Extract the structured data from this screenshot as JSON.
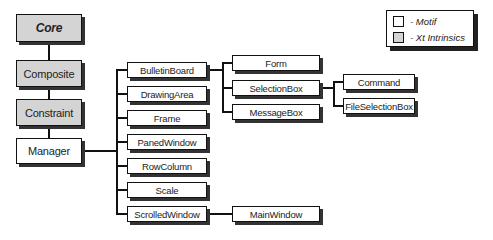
{
  "diagram": {
    "type": "class-hierarchy",
    "nodes": {
      "core": "Core",
      "composite": "Composite",
      "constraint": "Constraint",
      "manager": "Manager",
      "bulletinboard": "BulletinBoard",
      "drawingarea": "DrawingArea",
      "frame": "Frame",
      "panedwindow": "PanedWindow",
      "rowcolumn": "RowColumn",
      "scale": "Scale",
      "scrolledwindow": "ScrolledWindow",
      "form": "Form",
      "selectionbox": "SelectionBox",
      "messagebox": "MessageBox",
      "command": "Command",
      "fileselectionbox": "FileSelectionBox",
      "mainwindow": "MainWindow"
    },
    "edges": [
      [
        "Core",
        "Composite"
      ],
      [
        "Composite",
        "Constraint"
      ],
      [
        "Constraint",
        "Manager"
      ],
      [
        "Manager",
        "BulletinBoard"
      ],
      [
        "Manager",
        "DrawingArea"
      ],
      [
        "Manager",
        "Frame"
      ],
      [
        "Manager",
        "PanedWindow"
      ],
      [
        "Manager",
        "RowColumn"
      ],
      [
        "Manager",
        "Scale"
      ],
      [
        "Manager",
        "ScrolledWindow"
      ],
      [
        "BulletinBoard",
        "Form"
      ],
      [
        "BulletinBoard",
        "SelectionBox"
      ],
      [
        "BulletinBoard",
        "MessageBox"
      ],
      [
        "SelectionBox",
        "Command"
      ],
      [
        "SelectionBox",
        "FileSelectionBox"
      ],
      [
        "ScrolledWindow",
        "MainWindow"
      ]
    ]
  },
  "legend": {
    "motif": "- Motif",
    "xt": "- Xt Intrinsics"
  },
  "colors": {
    "motif_fill": "#ffffff",
    "xt_fill": "#d4d4d4",
    "line": "#111111"
  }
}
